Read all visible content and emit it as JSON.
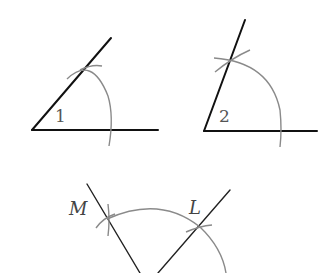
{
  "figures": [
    {
      "id": "angle-1",
      "label": "1",
      "vertex": [
        32,
        130
      ],
      "ray_end_horizontal": [
        158,
        130
      ],
      "ray_end_slant": [
        111,
        38
      ],
      "arc_radius": 77
    },
    {
      "id": "angle-2",
      "label": "2",
      "vertex": [
        204,
        131
      ],
      "ray_end_horizontal": [
        317,
        131
      ],
      "ray_end_slant": [
        245,
        20
      ],
      "arc_radius": 77
    },
    {
      "id": "construction-ml",
      "labels": {
        "m": "M",
        "l": "L"
      },
      "point_m": [
        107,
        219
      ],
      "point_l": [
        200,
        227
      ]
    }
  ],
  "colors": {
    "line": "#111111",
    "arc": "#8a8a8a",
    "text": "#555555"
  }
}
